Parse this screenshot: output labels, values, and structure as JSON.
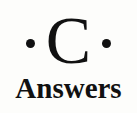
{
  "logo": {
    "letter": "C",
    "word": "Answers",
    "colors": {
      "ink": "#111111",
      "background": "#fdfdfb"
    }
  }
}
